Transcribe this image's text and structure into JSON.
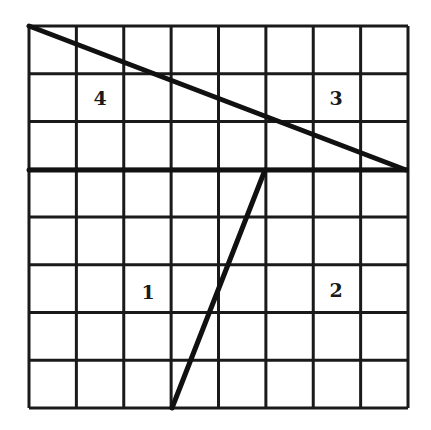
{
  "diagram": {
    "type": "grid-partition",
    "grid": {
      "columns": 8,
      "rows": 8,
      "left": 29,
      "top": 26,
      "right": 408,
      "bottom": 408,
      "line_color": "#1a1a1a"
    },
    "segments": [
      {
        "name": "horizontal-divider",
        "from": [
          29,
          170
        ],
        "to": [
          406,
          170
        ]
      },
      {
        "name": "diagonal-top",
        "from": [
          29,
          26
        ],
        "to": [
          406,
          170
        ]
      },
      {
        "name": "slanted-bottom",
        "from": [
          172,
          408
        ],
        "to": [
          265,
          170
        ]
      }
    ],
    "labels": [
      {
        "text": "4",
        "x": 100,
        "y": 105
      },
      {
        "text": "3",
        "x": 336,
        "y": 105
      },
      {
        "text": "1",
        "x": 148,
        "y": 299
      },
      {
        "text": "2",
        "x": 336,
        "y": 297
      }
    ]
  }
}
